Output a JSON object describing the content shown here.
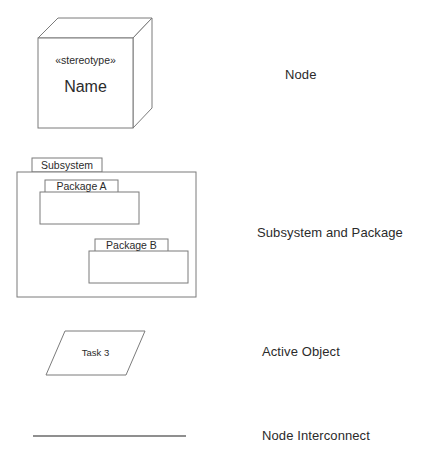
{
  "diagram": {
    "background_color": "#ffffff",
    "stroke_color": "#7b7b7b",
    "text_color": "#2b2b2b"
  },
  "node_shape": {
    "stereotype": "«stereotype»",
    "name": "Name"
  },
  "subsystem_shape": {
    "tab_label": "Subsystem",
    "packages": [
      {
        "tab_label": "Package A"
      },
      {
        "tab_label": "Package B"
      }
    ]
  },
  "active_object_shape": {
    "label": "Task 3"
  },
  "interconnect_shape": {
    "label": ""
  },
  "legend": {
    "items": [
      {
        "label": "Node"
      },
      {
        "label": "Subsystem and Package"
      },
      {
        "label": "Active Object"
      },
      {
        "label": "Node Interconnect"
      }
    ]
  }
}
